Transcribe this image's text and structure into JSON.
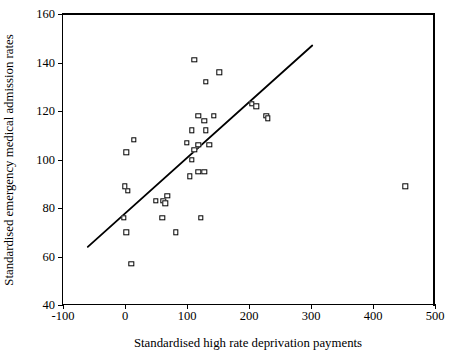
{
  "chart_data": {
    "type": "scatter",
    "title": "",
    "xlabel": "Standardised high rate deprivation payments",
    "ylabel": "Standardised emergency medical admission rates",
    "xlim": [
      -100,
      500
    ],
    "ylim": [
      40,
      160
    ],
    "xticks": [
      -100,
      0,
      100,
      200,
      300,
      400,
      500
    ],
    "yticks": [
      40,
      60,
      80,
      100,
      120,
      140,
      160
    ],
    "xtick_labels": [
      "-100",
      "0",
      "100",
      "200",
      "300",
      "400",
      "500"
    ],
    "ytick_labels": [
      "40",
      "60",
      "80",
      "100",
      "120",
      "140",
      "160"
    ],
    "grid": false,
    "legend": null,
    "marker": "open-square",
    "points": [
      {
        "x": 2,
        "y": 103
      },
      {
        "x": 14,
        "y": 108
      },
      {
        "x": 0,
        "y": 89
      },
      {
        "x": 5,
        "y": 87
      },
      {
        "x": -2,
        "y": 76
      },
      {
        "x": 2,
        "y": 70
      },
      {
        "x": 10,
        "y": 57
      },
      {
        "x": 50,
        "y": 83
      },
      {
        "x": 62,
        "y": 83
      },
      {
        "x": 65,
        "y": 82
      },
      {
        "x": 68,
        "y": 85
      },
      {
        "x": 60,
        "y": 76
      },
      {
        "x": 82,
        "y": 70
      },
      {
        "x": 105,
        "y": 93
      },
      {
        "x": 118,
        "y": 95
      },
      {
        "x": 128,
        "y": 95
      },
      {
        "x": 108,
        "y": 100
      },
      {
        "x": 100,
        "y": 107
      },
      {
        "x": 112,
        "y": 104
      },
      {
        "x": 118,
        "y": 106
      },
      {
        "x": 136,
        "y": 106
      },
      {
        "x": 108,
        "y": 112
      },
      {
        "x": 130,
        "y": 112
      },
      {
        "x": 118,
        "y": 118
      },
      {
        "x": 143,
        "y": 118
      },
      {
        "x": 128,
        "y": 116
      },
      {
        "x": 112,
        "y": 141
      },
      {
        "x": 130,
        "y": 132
      },
      {
        "x": 152,
        "y": 136
      },
      {
        "x": 122,
        "y": 76
      },
      {
        "x": 205,
        "y": 123
      },
      {
        "x": 212,
        "y": 122
      },
      {
        "x": 228,
        "y": 118
      },
      {
        "x": 230,
        "y": 117
      },
      {
        "x": 452,
        "y": 89
      }
    ],
    "fit_line": {
      "type": "linear-regression",
      "x_start": -60,
      "y_start": 64,
      "x_end": 302,
      "y_end": 147
    }
  }
}
